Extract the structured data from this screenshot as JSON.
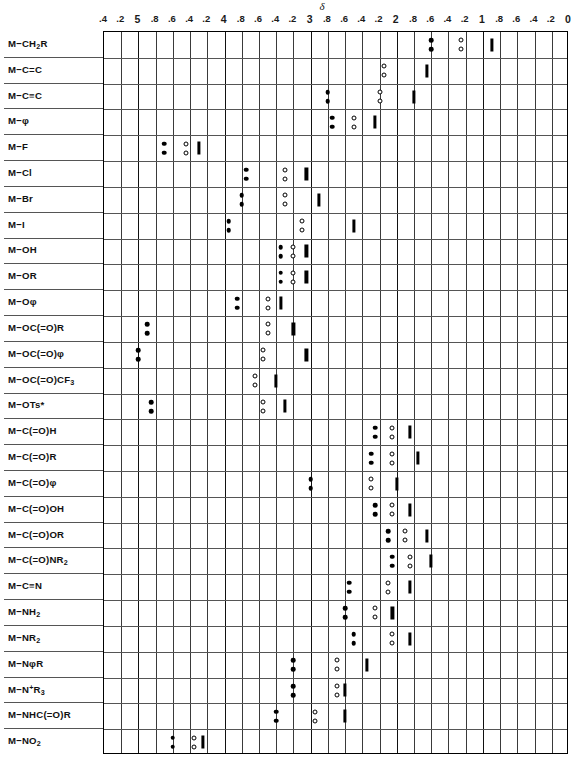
{
  "chart": {
    "axis_title": "δ",
    "type": "chart"
  },
  "axis": {
    "label": "δ",
    "ticks": [
      ".4",
      ".2",
      "5",
      ".8",
      ".6",
      ".4",
      ".2",
      "4",
      ".8",
      ".6",
      ".4",
      ".2",
      "3",
      ".8",
      ".6",
      ".4",
      ".2",
      "2",
      ".8",
      ".6",
      ".4",
      ".2",
      "1",
      ".8",
      ".6",
      ".4",
      ".2",
      "0"
    ],
    "values": [
      5.4,
      5.2,
      5.0,
      4.8,
      4.6,
      4.4,
      4.2,
      4.0,
      3.8,
      3.6,
      3.4,
      3.2,
      3.0,
      2.8,
      2.6,
      2.4,
      2.2,
      2.0,
      1.8,
      1.6,
      1.4,
      1.2,
      1.0,
      0.8,
      0.6,
      0.4,
      0.2,
      0.0
    ],
    "major": [
      false,
      false,
      true,
      false,
      false,
      false,
      false,
      true,
      false,
      false,
      false,
      false,
      true,
      false,
      false,
      false,
      false,
      true,
      false,
      false,
      false,
      false,
      true,
      false,
      false,
      false,
      false,
      true
    ]
  },
  "rows": [
    {
      "label_html": "M&minus;CH<sub>2</sub>R",
      "plain": "M-CH2R"
    },
    {
      "label_html": "M&minus;C&#61;C",
      "plain": "M-C=C"
    },
    {
      "label_html": "M&minus;C&#8801;C",
      "plain": "M-C#C"
    },
    {
      "label_html": "M&minus;&phi;",
      "plain": "M-phi"
    },
    {
      "label_html": "M&minus;F",
      "plain": "M-F"
    },
    {
      "label_html": "M&minus;Cl",
      "plain": "M-Cl"
    },
    {
      "label_html": "M&minus;Br",
      "plain": "M-Br"
    },
    {
      "label_html": "M&minus;I",
      "plain": "M-I"
    },
    {
      "label_html": "M&minus;OH",
      "plain": "M-OH"
    },
    {
      "label_html": "M&minus;OR",
      "plain": "M-OR"
    },
    {
      "label_html": "M&minus;O&phi;",
      "plain": "M-Ophi"
    },
    {
      "label_html": "M&minus;OC(&#61;O)R",
      "plain": "M-OC(=O)R"
    },
    {
      "label_html": "M&minus;OC(&#61;O)&phi;",
      "plain": "M-OC(=O)phi"
    },
    {
      "label_html": "M&minus;OC(&#61;O)CF<sub>3</sub>",
      "plain": "M-OC(=O)CF3"
    },
    {
      "label_html": "M&minus;OTs*",
      "plain": "M-OTs*"
    },
    {
      "label_html": "M&minus;C(&#61;O)H",
      "plain": "M-C(=O)H"
    },
    {
      "label_html": "M&minus;C(&#61;O)R",
      "plain": "M-C(=O)R"
    },
    {
      "label_html": "M&minus;C(&#61;O)&phi;",
      "plain": "M-C(=O)phi"
    },
    {
      "label_html": "M&minus;C(&#61;O)OH",
      "plain": "M-C(=O)OH"
    },
    {
      "label_html": "M&minus;C(&#61;O)OR",
      "plain": "M-C(=O)OR"
    },
    {
      "label_html": "M&minus;C(&#61;O)NR<sub>2</sub>",
      "plain": "M-C(=O)NR2"
    },
    {
      "label_html": "M&minus;C&#8801;N",
      "plain": "M-C#N"
    },
    {
      "label_html": "M&minus;NH<sub>2</sub>",
      "plain": "M-NH2"
    },
    {
      "label_html": "M&minus;NR<sub>2</sub>",
      "plain": "M-NR2"
    },
    {
      "label_html": "M&minus;N&phi;R",
      "plain": "M-NphiR"
    },
    {
      "label_html": "M&minus;N<sup>+</sup>R<sub>3</sub>",
      "plain": "M-N+R3"
    },
    {
      "label_html": "M&minus;NHC(&#61;O)R",
      "plain": "M-NHC(=O)R"
    },
    {
      "label_html": "M&minus;NO<sub>2</sub>",
      "plain": "M-NO2"
    }
  ],
  "chart_data": {
    "type": "scatter",
    "title": "",
    "xlabel": "δ",
    "ylabel": "",
    "xlim": [
      5.4,
      0.0
    ],
    "x_reversed": true,
    "grid": true,
    "legend": [
      "filled circle = CH3 / methyl",
      "open circle = CH2 / methylene",
      "bar = CH / methine"
    ],
    "marker_kinds": [
      "filled",
      "open",
      "bar"
    ],
    "categories": [
      "M-CH2R",
      "M-C=C",
      "M-C#C",
      "M-phi",
      "M-F",
      "M-Cl",
      "M-Br",
      "M-I",
      "M-OH",
      "M-OR",
      "M-Ophi",
      "M-OC(=O)R",
      "M-OC(=O)phi",
      "M-OC(=O)CF3",
      "M-OTs*",
      "M-C(=O)H",
      "M-C(=O)R",
      "M-C(=O)phi",
      "M-C(=O)OH",
      "M-C(=O)OR",
      "M-C(=O)NR2",
      "M-C#N",
      "M-NH2",
      "M-NR2",
      "M-NphiR",
      "M-N+R3",
      "M-NHC(=O)R",
      "M-NO2"
    ],
    "series": [
      {
        "row": "M-CH2R",
        "filled": [
          1.6,
          1.6
        ],
        "open": [
          1.25,
          1.25
        ],
        "bar": [
          0.9
        ]
      },
      {
        "row": "M-C=C",
        "filled": [],
        "open": [
          2.15,
          2.15
        ],
        "bar": [
          1.65
        ]
      },
      {
        "row": "M-C#C",
        "filled": [
          2.8,
          2.8
        ],
        "open": [
          2.2,
          2.2
        ],
        "bar": [
          1.8
        ]
      },
      {
        "row": "M-phi",
        "filled": [
          2.75,
          2.75
        ],
        "open": [
          2.5,
          2.5
        ],
        "bar": [
          2.25
        ]
      },
      {
        "row": "M-F",
        "filled": [
          4.7,
          4.7
        ],
        "open": [
          4.45,
          4.45
        ],
        "bar": [
          4.3
        ]
      },
      {
        "row": "M-Cl",
        "filled": [
          3.75,
          3.75
        ],
        "open": [
          3.3,
          3.3
        ],
        "bar": [
          3.05
        ]
      },
      {
        "row": "M-Br",
        "filled": [
          3.8,
          3.8
        ],
        "open": [
          3.3,
          3.3
        ],
        "bar": [
          2.9
        ]
      },
      {
        "row": "M-I",
        "filled": [
          3.95,
          3.95
        ],
        "open": [
          3.1,
          3.1
        ],
        "bar": [
          2.5
        ]
      },
      {
        "row": "M-OH",
        "filled": [
          3.35,
          3.35
        ],
        "open": [
          3.2,
          3.2
        ],
        "bar": [
          3.05
        ]
      },
      {
        "row": "M-OR",
        "filled": [
          3.35,
          3.35
        ],
        "open": [
          3.2,
          3.2
        ],
        "bar": [
          3.05
        ]
      },
      {
        "row": "M-Ophi",
        "filled": [
          3.85,
          3.85
        ],
        "open": [
          3.5,
          3.5
        ],
        "bar": [
          3.35
        ]
      },
      {
        "row": "M-OC(=O)R",
        "filled": [
          4.9,
          4.9
        ],
        "open": [
          3.5,
          3.5
        ],
        "bar": [
          3.2
        ]
      },
      {
        "row": "M-OC(=O)phi",
        "filled": [
          5.0,
          5.0
        ],
        "open": [
          3.55,
          3.55
        ],
        "bar": [
          3.05
        ]
      },
      {
        "row": "M-OC(=O)CF3",
        "filled": [],
        "open": [
          3.65,
          3.65
        ],
        "bar": [
          3.4
        ]
      },
      {
        "row": "M-OTs*",
        "filled": [
          4.85,
          4.85
        ],
        "open": [
          3.55,
          3.55
        ],
        "bar": [
          3.3
        ]
      },
      {
        "row": "M-C(=O)H",
        "filled": [
          2.25,
          2.25
        ],
        "open": [
          2.05,
          2.05
        ],
        "bar": [
          1.85
        ]
      },
      {
        "row": "M-C(=O)R",
        "filled": [
          2.3,
          2.3
        ],
        "open": [
          2.05,
          2.05
        ],
        "bar": [
          1.75
        ]
      },
      {
        "row": "M-C(=O)phi",
        "filled": [
          3.0,
          3.0
        ],
        "open": [
          2.3,
          2.3
        ],
        "bar": [
          2.0
        ]
      },
      {
        "row": "M-C(=O)OH",
        "filled": [
          2.25,
          2.25
        ],
        "open": [
          2.05,
          2.05
        ],
        "bar": [
          1.85
        ]
      },
      {
        "row": "M-C(=O)OR",
        "filled": [
          2.1,
          2.1
        ],
        "open": [
          1.9,
          1.9
        ],
        "bar": [
          1.65
        ]
      },
      {
        "row": "M-C(=O)NR2",
        "filled": [
          2.05,
          2.05
        ],
        "open": [
          1.85,
          1.85
        ],
        "bar": [
          1.6
        ]
      },
      {
        "row": "M-C#N",
        "filled": [
          2.55,
          2.55
        ],
        "open": [
          2.1,
          2.1
        ],
        "bar": [
          1.85
        ]
      },
      {
        "row": "M-NH2",
        "filled": [
          2.6,
          2.6
        ],
        "open": [
          2.25,
          2.25
        ],
        "bar": [
          2.05
        ]
      },
      {
        "row": "M-NR2",
        "filled": [
          2.5,
          2.5
        ],
        "open": [
          2.05,
          2.05
        ],
        "bar": [
          1.85
        ]
      },
      {
        "row": "M-NphiR",
        "filled": [
          3.2,
          3.2
        ],
        "open": [
          2.7,
          2.7
        ],
        "bar": [
          2.35
        ]
      },
      {
        "row": "M-N+R3",
        "filled": [
          3.2,
          3.2
        ],
        "open": [
          2.7,
          2.7
        ],
        "bar": [
          2.6
        ]
      },
      {
        "row": "M-NHC(=O)R",
        "filled": [
          3.4,
          3.4
        ],
        "open": [
          2.95,
          2.95
        ],
        "bar": [
          2.6
        ]
      },
      {
        "row": "M-NO2",
        "filled": [
          4.6,
          4.6
        ],
        "open": [
          4.35,
          4.35
        ],
        "bar": [
          4.25
        ]
      }
    ]
  }
}
